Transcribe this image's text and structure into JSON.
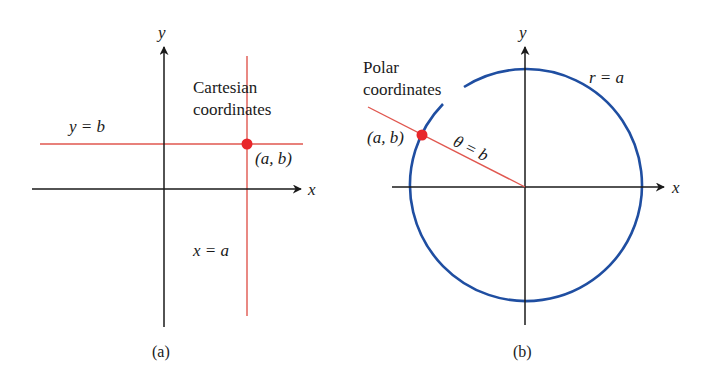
{
  "colors": {
    "axis": "#1a1a1a",
    "red_line": "#e0574f",
    "point": "#e8262a",
    "circle": "#1f4ea1"
  },
  "panel_a": {
    "caption": "(a)",
    "title_line1": "Cartesian",
    "title_line2": "coordinates",
    "x_axis_label": "x",
    "y_axis_label": "y",
    "horizontal_line_label": "y = b",
    "vertical_line_label": "x = a",
    "point_label": "(a, b)"
  },
  "panel_b": {
    "caption": "(b)",
    "title_line1": "Polar",
    "title_line2": "coordinates",
    "x_axis_label": "x",
    "y_axis_label": "y",
    "circle_label": "r = a",
    "ray_label": "θ = b",
    "point_label": "(a, b)"
  }
}
